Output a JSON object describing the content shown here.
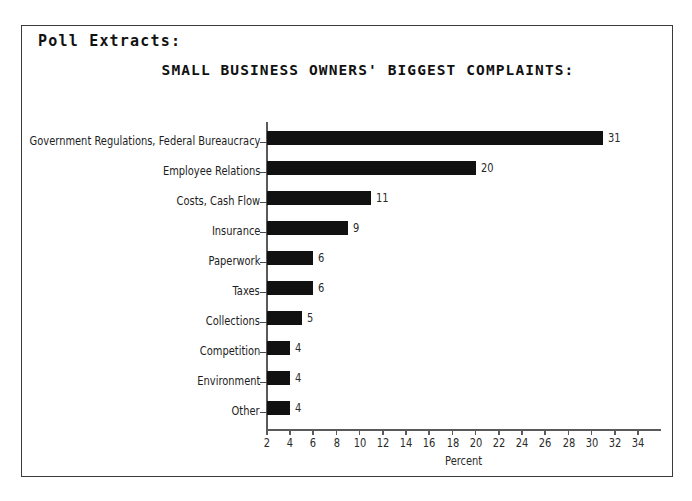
{
  "document": {
    "heading": "Poll Extracts:"
  },
  "chart_data": {
    "type": "bar",
    "orientation": "horizontal",
    "title": "SMALL BUSINESS OWNERS' BIGGEST COMPLAINTS:",
    "xlabel": "Percent",
    "ylabel": "",
    "xlim": [
      2,
      34
    ],
    "xticks": [
      2,
      4,
      6,
      8,
      10,
      12,
      14,
      16,
      18,
      20,
      22,
      24,
      26,
      28,
      30,
      32,
      34
    ],
    "grid": false,
    "legend": false,
    "categories": [
      "Government Regulations, Federal Bureaucracy",
      "Employee Relations",
      "Costs, Cash Flow",
      "Insurance",
      "Paperwork",
      "Taxes",
      "Collections",
      "Competition",
      "Environment",
      "Other"
    ],
    "values": [
      31,
      20,
      11,
      9,
      6,
      6,
      5,
      4,
      4,
      4
    ],
    "value_labels": [
      "31",
      "20",
      "11",
      "9",
      "6",
      "6",
      "5",
      "4",
      "4",
      "4"
    ],
    "bar_color": "#111111",
    "axis_color": "#5a5a5a",
    "background_color": "#ffffff"
  }
}
